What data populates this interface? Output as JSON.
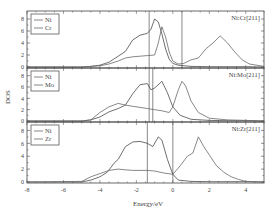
{
  "figure": {
    "ylabel": "DOS",
    "xlabel": "Energy/eV",
    "xlim": [
      -8,
      5
    ],
    "xticks": [
      -8,
      -6,
      -4,
      -2,
      0,
      2,
      4
    ],
    "xtick_labels": [
      "-8",
      "-6",
      "-4",
      "-2",
      "0",
      "2",
      "4"
    ],
    "yticks": [
      0,
      2,
      4,
      6,
      8
    ],
    "ytick_labels": [
      "0",
      "2",
      "4",
      "6",
      "8"
    ],
    "colors": {
      "line": "#555555",
      "frame": "#444444",
      "background": "#ffffff"
    }
  },
  "panels": [
    {
      "title": "Ni:Cr[211]",
      "legend": [
        "Ni",
        "Cr"
      ]
    },
    {
      "title": "Ni:Mo[211]",
      "legend": [
        "Ni",
        "Mo"
      ]
    },
    {
      "title": "Ni:Zr[211]",
      "legend": [
        "Ni",
        "Zr"
      ]
    }
  ],
  "chart_data": [
    {
      "type": "line",
      "title": "Ni:Cr[211]",
      "xlabel": "Energy/eV",
      "ylabel": "DOS",
      "xlim": [
        -8,
        5
      ],
      "ylim": [
        0,
        9
      ],
      "vlines": [
        -1.3,
        0.5
      ],
      "series": [
        {
          "name": "Ni",
          "x": [
            -8,
            -5,
            -4.5,
            -4,
            -3.5,
            -3,
            -2.6,
            -2.2,
            -1.8,
            -1.4,
            -1.2,
            -1.0,
            -0.8,
            -0.6,
            -0.4,
            -0.2,
            0,
            0.3,
            1,
            2,
            3,
            4,
            5
          ],
          "y": [
            0,
            0,
            0.1,
            0.3,
            0.8,
            1.8,
            2.6,
            4.5,
            5.3,
            5.6,
            6.3,
            8.0,
            7.5,
            5.5,
            3.0,
            1.3,
            0.6,
            0.3,
            0.1,
            0.05,
            0.05,
            0.05,
            0
          ]
        },
        {
          "name": "Cr",
          "x": [
            -8,
            -5,
            -4.5,
            -4,
            -3.5,
            -3,
            -2.6,
            -2.2,
            -1.8,
            -1.4,
            -1.0,
            -0.8,
            -0.6,
            -0.4,
            -0.2,
            0,
            0.3,
            0.6,
            1.0,
            1.4,
            1.8,
            2.2,
            2.6,
            3.0,
            3.4,
            3.8,
            4.2,
            4.6,
            5
          ],
          "y": [
            0,
            0,
            0.1,
            0.2,
            0.5,
            1.0,
            1.5,
            1.7,
            1.8,
            1.9,
            2.0,
            4.0,
            6.7,
            5.0,
            2.5,
            1.0,
            0.5,
            0.6,
            1.2,
            1.5,
            3.0,
            4.0,
            5.2,
            4.0,
            2.5,
            1.2,
            0.5,
            0.3,
            0.1
          ]
        }
      ]
    },
    {
      "type": "line",
      "title": "Ni:Mo[211]",
      "xlabel": "Energy/eV",
      "ylabel": "DOS",
      "xlim": [
        -8,
        5
      ],
      "ylim": [
        0,
        9
      ],
      "vlines": [
        -1.3,
        -1.1
      ],
      "series": [
        {
          "name": "Ni",
          "x": [
            -8,
            -5,
            -4.5,
            -4,
            -3.5,
            -3,
            -2.6,
            -2.2,
            -1.8,
            -1.4,
            -1.2,
            -1.0,
            -0.6,
            -0.3,
            0,
            0.4,
            1,
            2,
            3,
            4,
            5
          ],
          "y": [
            0,
            0,
            0.2,
            0.7,
            1.6,
            2.2,
            2.8,
            4.8,
            6.4,
            6.6,
            5.5,
            5.8,
            7.0,
            5.0,
            2.5,
            1.0,
            0.3,
            0.1,
            0.05,
            0.05,
            0
          ]
        },
        {
          "name": "Mo",
          "x": [
            -8,
            -5,
            -4.5,
            -4,
            -3.5,
            -3,
            -2.6,
            -2.2,
            -1.8,
            -1.4,
            -1.0,
            -0.6,
            -0.2,
            0,
            0.3,
            0.5,
            0.7,
            1.0,
            1.4,
            2,
            3,
            4,
            5
          ],
          "y": [
            0,
            0,
            0.2,
            1.5,
            2.5,
            3.1,
            2.8,
            2.6,
            2.4,
            2.2,
            2.0,
            1.8,
            1.5,
            2.5,
            5.5,
            7.0,
            6.2,
            3.5,
            1.5,
            0.5,
            0.2,
            0.1,
            0
          ]
        }
      ]
    },
    {
      "type": "line",
      "title": "Ni:Zr[211]",
      "xlabel": "Energy/eV",
      "ylabel": "DOS",
      "xlim": [
        -8,
        5
      ],
      "ylim": [
        0,
        9
      ],
      "vlines": [
        -1.4,
        0.0
      ],
      "series": [
        {
          "name": "Ni",
          "x": [
            -8,
            -5,
            -4.5,
            -4,
            -3.6,
            -3.2,
            -3.0,
            -2.6,
            -2.2,
            -1.8,
            -1.4,
            -1.1,
            -0.8,
            -0.6,
            -0.3,
            0,
            0.3,
            1,
            2,
            3,
            4,
            5
          ],
          "y": [
            0,
            0,
            0.3,
            0.8,
            1.5,
            3.0,
            3.5,
            5.5,
            6.2,
            6.3,
            6.0,
            5.5,
            7.0,
            6.5,
            3.5,
            1.2,
            0.3,
            0.1,
            0.05,
            0.05,
            0.05,
            0
          ]
        },
        {
          "name": "Zr",
          "x": [
            -8,
            -5,
            -4.5,
            -4,
            -3.5,
            -3,
            -2.6,
            -2.2,
            -1.8,
            -1.4,
            -1.0,
            -0.5,
            0,
            0.4,
            0.8,
            1.1,
            1.4,
            1.7,
            2.0,
            2.4,
            2.8,
            3.2,
            3.6,
            4,
            5
          ],
          "y": [
            0,
            0.1,
            0.8,
            1.3,
            1.8,
            2.0,
            1.9,
            1.8,
            1.8,
            1.8,
            1.7,
            1.4,
            1.2,
            2.5,
            4.0,
            4.5,
            7.0,
            5.5,
            4.2,
            2.5,
            1.5,
            0.8,
            0.4,
            0.1,
            0
          ]
        }
      ]
    }
  ]
}
